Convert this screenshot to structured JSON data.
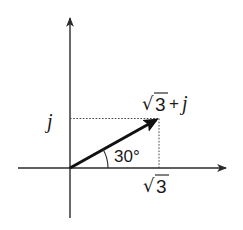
{
  "diagram": {
    "type": "complex-plane-phasor",
    "colors": {
      "axis": "#2a2a2a",
      "vector": "#111111",
      "dotted": "#444444",
      "text": "#1a1a1a",
      "background": "#ffffff"
    },
    "axes": {
      "horizontal": {
        "x1": 18,
        "y1": 168,
        "x2": 228,
        "y2": 168
      },
      "vertical": {
        "x1": 70,
        "y1": 218,
        "x2": 70,
        "y2": 16
      }
    },
    "vector": {
      "from": {
        "x": 70,
        "y": 168
      },
      "to": {
        "x": 159,
        "y": 118
      },
      "label_radical": "√",
      "label_radicand": "3",
      "label_suffix_op": "+",
      "label_suffix_var": "j"
    },
    "projections": {
      "horizontal_dotted": {
        "x1": 70,
        "y1": 118,
        "x2": 159,
        "y2": 118
      },
      "vertical_dotted": {
        "x1": 159,
        "y1": 118,
        "x2": 159,
        "y2": 168
      }
    },
    "labels": {
      "imag_tick": "j",
      "real_tick_radical": "√",
      "real_tick_radicand": "3",
      "angle": "30°"
    }
  }
}
